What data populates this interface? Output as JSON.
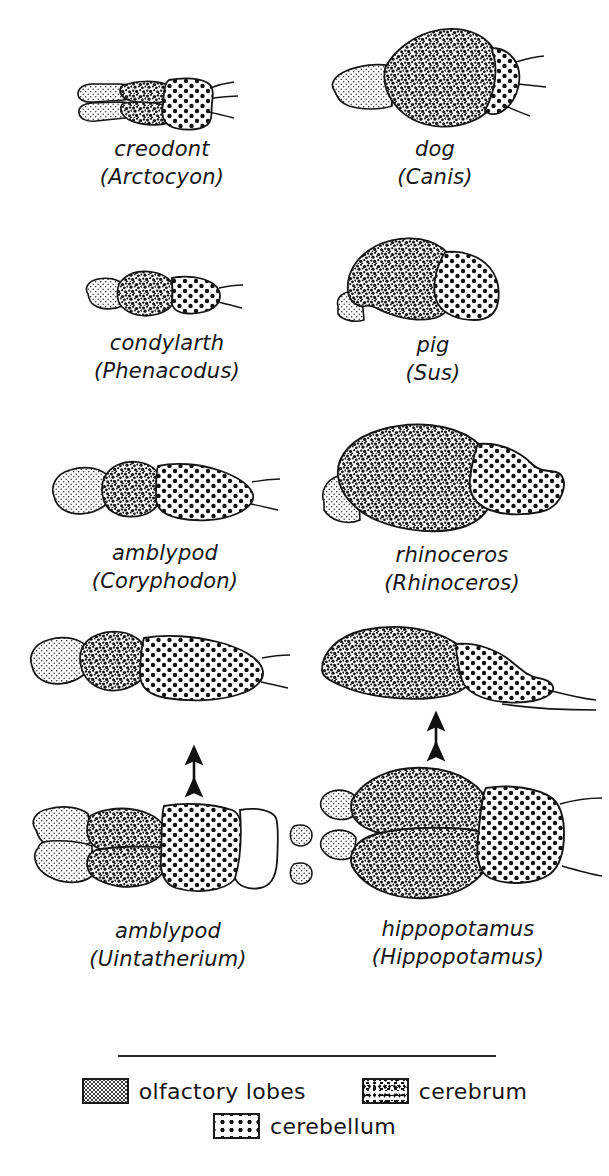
{
  "figure": {
    "view_note": "paired archaic and modern ungulate/carnivore brains"
  },
  "panels": [
    {
      "id": "creodont",
      "common_name": "creodont",
      "scientific_name": "(Arctocyon)",
      "view": "dorsal",
      "column": "left",
      "row": 1
    },
    {
      "id": "dog",
      "common_name": "dog",
      "scientific_name": "(Canis)",
      "view": "lateral",
      "column": "right",
      "row": 1
    },
    {
      "id": "condylarth",
      "common_name": "condylarth",
      "scientific_name": "(Phenacodus)",
      "view": "lateral",
      "column": "left",
      "row": 2
    },
    {
      "id": "pig",
      "common_name": "pig",
      "scientific_name": "(Sus)",
      "view": "lateral",
      "column": "right",
      "row": 2
    },
    {
      "id": "amblypod-coryphodon",
      "common_name": "amblypod",
      "scientific_name": "(Coryphodon)",
      "view": "lateral",
      "column": "left",
      "row": 3
    },
    {
      "id": "rhinoceros",
      "common_name": "rhinoceros",
      "scientific_name": "(Rhinoceros)",
      "view": "lateral",
      "column": "right",
      "row": 3
    },
    {
      "id": "amblypod-uintatherium",
      "common_name": "amblypod",
      "scientific_name": "(Uintatherium)",
      "view": "lateral and dorsal",
      "column": "left",
      "row": 4
    },
    {
      "id": "hippopotamus",
      "common_name": "hippopotamus",
      "scientific_name": "(Hippopotamus)",
      "view": "lateral and dorsal",
      "column": "right",
      "row": 4
    }
  ],
  "legend": {
    "items": [
      {
        "id": "olfactory-lobes",
        "label": "olfactory lobes",
        "pattern": "fine-stipple"
      },
      {
        "id": "cerebrum",
        "label": "cerebrum",
        "pattern": "dense-mottle"
      },
      {
        "id": "cerebellum",
        "label": "cerebellum",
        "pattern": "coarse-dots"
      }
    ]
  },
  "colors": {
    "ink": "#1a1a1a",
    "paper": "#ffffff"
  }
}
